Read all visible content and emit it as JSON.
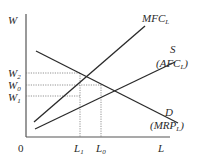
{
  "diagram": {
    "title": "",
    "axes": {
      "y_label": "W",
      "x_label": "L",
      "origin_label": "0"
    },
    "curves": {
      "mfc": {
        "label": "MFC",
        "sub": "L"
      },
      "supply": {
        "label": "S",
        "label2": "(AFC",
        "sub": "L",
        "close": ")"
      },
      "demand": {
        "label": "D",
        "label2": "(MRP",
        "sub": "L",
        "close": ")"
      }
    },
    "y_ticks": [
      {
        "label": "W",
        "sub": "2"
      },
      {
        "label": "W",
        "sub": "0"
      },
      {
        "label": "W",
        "sub": "1"
      }
    ],
    "x_ticks": [
      {
        "label": "L",
        "sub": "1"
      },
      {
        "label": "L",
        "sub": "0"
      }
    ],
    "colors": {
      "line": "#2a2a2a",
      "axis": "#555555",
      "guide": "#777777"
    }
  }
}
